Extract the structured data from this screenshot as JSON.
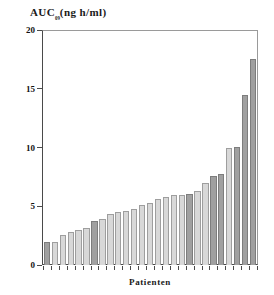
{
  "chart_data": {
    "type": "bar",
    "title_main": "AUC",
    "title_sub": "₀₉",
    "title_unit": "(ng h/ml)",
    "xlabel": "Patienten",
    "ylabel": "",
    "ylim": [
      0,
      20
    ],
    "yticks": [
      0,
      5,
      10,
      15,
      20
    ],
    "ytick_labels": [
      "0",
      "5",
      "10",
      "15",
      "20"
    ],
    "grid": false,
    "legend": "none",
    "categories": [
      "1",
      "2",
      "3",
      "4",
      "5",
      "6",
      "7",
      "8",
      "9",
      "10",
      "11",
      "12",
      "13",
      "14",
      "15",
      "16",
      "17",
      "18",
      "19",
      "20",
      "21",
      "22",
      "23",
      "24",
      "25",
      "26",
      "27"
    ],
    "values": [
      2.0,
      2.0,
      2.6,
      2.8,
      3.0,
      3.2,
      3.8,
      3.9,
      4.4,
      4.5,
      4.6,
      4.8,
      5.1,
      5.3,
      5.6,
      5.8,
      6.0,
      6.0,
      6.1,
      6.3,
      7.0,
      7.6,
      7.8,
      10.0,
      10.1,
      14.5,
      17.6
    ],
    "bar_shades": [
      "dark",
      "light",
      "light",
      "light",
      "light",
      "light",
      "dark",
      "light",
      "light",
      "light",
      "light",
      "light",
      "light",
      "light",
      "light",
      "light",
      "light",
      "light",
      "dark",
      "light",
      "light",
      "dark",
      "dark",
      "light",
      "dark",
      "dark",
      "dark"
    ],
    "colors": {
      "bar_light": "#d8d8d8",
      "bar_dark": "#a0a0a0",
      "bar_border": "#8d8d8d",
      "axis": "#4a4a4a",
      "text": "#1a1a1a",
      "background": "#ffffff"
    }
  }
}
